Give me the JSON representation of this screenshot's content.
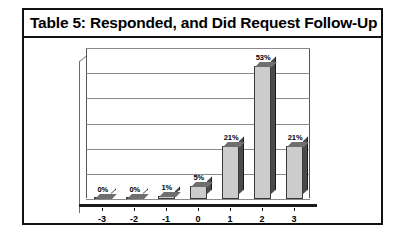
{
  "figure": {
    "title": "Table 5: Responded, and Did Request Follow-Up"
  },
  "chart_data": {
    "type": "bar",
    "title": "Table 5: Responded, and Did Request Follow-Up",
    "xlabel": "",
    "ylabel": "",
    "categories": [
      "-3",
      "-2",
      "-1",
      "0",
      "1",
      "2",
      "3"
    ],
    "values": [
      0,
      0,
      1,
      5,
      21,
      53,
      21
    ],
    "data_labels": [
      "0%",
      "0%",
      "1%",
      "5%",
      "21%",
      "53%",
      "21%"
    ],
    "ylim": [
      0,
      60
    ],
    "y_gridline_values": [
      0,
      10,
      20,
      30,
      40,
      50,
      60
    ],
    "y_tick_labels_visible": false,
    "grid": true,
    "legend": false,
    "style": "3d-column",
    "colors": {
      "bar_front": "#cccccc",
      "bar_side": "#4a4a4a",
      "bar_outline": "#3a3a3a",
      "gridline": "#8a8a8a",
      "axis": "#1a1a1a",
      "frame": "#111111",
      "background": "#ffffff",
      "text": "#000000"
    }
  }
}
